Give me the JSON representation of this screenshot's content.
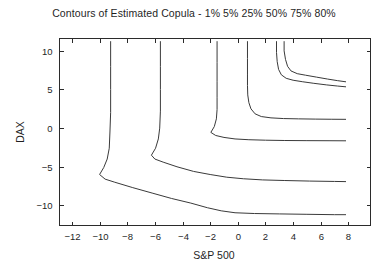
{
  "figure": {
    "width": 388,
    "height": 272,
    "background": "#ffffff",
    "line_color": "#3a3a3a",
    "axis_color": "#2b2b2b",
    "text_color": "#1f1f1f"
  },
  "chart_data": {
    "type": "line",
    "title": "Contours of Estimated Copula - 1% 5% 25% 50% 75% 80%",
    "xlabel": "S&P 500",
    "ylabel": "DAX",
    "xlim": [
      -12.9,
      9.6
    ],
    "ylim": [
      -12.6,
      11.6
    ],
    "xticks": [
      -12,
      -10,
      -8,
      -6,
      -4,
      -2,
      0,
      2,
      4,
      6,
      8
    ],
    "xticklabels": [
      "-12",
      "-10",
      "-8",
      "-6",
      "-4",
      "-2",
      "0",
      "2",
      "4",
      "6",
      "8"
    ],
    "yticks": [
      10,
      5,
      0,
      -5,
      -10
    ],
    "yticklabels": [
      "10",
      "5",
      "0",
      "-5",
      "-10"
    ],
    "grid": false,
    "legend": "none",
    "legend_in_title": true,
    "series": [
      {
        "name": "1%",
        "level": 0.01,
        "points": [
          [
            -9.2,
            11.2
          ],
          [
            -9.2,
            8.0
          ],
          [
            -9.2,
            5.0
          ],
          [
            -9.2,
            2.0
          ],
          [
            -9.25,
            -0.5
          ],
          [
            -9.3,
            -2.6
          ],
          [
            -9.45,
            -4.0
          ],
          [
            -9.7,
            -5.1
          ],
          [
            -10.0,
            -6.0
          ],
          [
            -9.6,
            -6.6
          ],
          [
            -8.9,
            -7.0
          ],
          [
            -7.6,
            -7.7
          ],
          [
            -6.2,
            -8.4
          ],
          [
            -4.8,
            -9.1
          ],
          [
            -3.4,
            -9.7
          ],
          [
            -2.2,
            -10.3
          ],
          [
            -1.2,
            -10.7
          ],
          [
            -0.2,
            -10.95
          ],
          [
            1.2,
            -11.05
          ],
          [
            3.0,
            -11.1
          ],
          [
            5.0,
            -11.15
          ],
          [
            7.0,
            -11.2
          ],
          [
            7.8,
            -11.2
          ]
        ]
      },
      {
        "name": "5%",
        "level": 0.05,
        "points": [
          [
            -5.6,
            11.2
          ],
          [
            -5.6,
            8.0
          ],
          [
            -5.6,
            5.0
          ],
          [
            -5.6,
            2.2
          ],
          [
            -5.65,
            0.0
          ],
          [
            -5.75,
            -1.4
          ],
          [
            -5.95,
            -2.6
          ],
          [
            -6.25,
            -3.5
          ],
          [
            -6.0,
            -4.0
          ],
          [
            -5.4,
            -4.4
          ],
          [
            -4.4,
            -5.0
          ],
          [
            -3.2,
            -5.6
          ],
          [
            -2.0,
            -6.0
          ],
          [
            -0.8,
            -6.35
          ],
          [
            0.4,
            -6.55
          ],
          [
            1.8,
            -6.7
          ],
          [
            3.4,
            -6.78
          ],
          [
            5.2,
            -6.85
          ],
          [
            7.0,
            -6.9
          ],
          [
            7.8,
            -6.92
          ]
        ]
      },
      {
        "name": "25%",
        "level": 0.25,
        "points": [
          [
            -1.5,
            11.2
          ],
          [
            -1.5,
            8.5
          ],
          [
            -1.5,
            6.0
          ],
          [
            -1.5,
            4.0
          ],
          [
            -1.5,
            2.4
          ],
          [
            -1.55,
            1.2
          ],
          [
            -1.7,
            0.2
          ],
          [
            -1.95,
            -0.55
          ],
          [
            -1.6,
            -0.95
          ],
          [
            -1.0,
            -1.2
          ],
          [
            -0.2,
            -1.4
          ],
          [
            0.8,
            -1.5
          ],
          [
            2.0,
            -1.56
          ],
          [
            3.4,
            -1.6
          ],
          [
            5.0,
            -1.62
          ],
          [
            6.6,
            -1.63
          ],
          [
            7.8,
            -1.64
          ]
        ]
      },
      {
        "name": "50%",
        "level": 0.5,
        "points": [
          [
            0.7,
            11.2
          ],
          [
            0.7,
            9.0
          ],
          [
            0.7,
            7.0
          ],
          [
            0.7,
            5.5
          ],
          [
            0.72,
            4.3
          ],
          [
            0.8,
            3.3
          ],
          [
            0.95,
            2.5
          ],
          [
            1.25,
            1.85
          ],
          [
            1.7,
            1.5
          ],
          [
            2.4,
            1.33
          ],
          [
            3.3,
            1.24
          ],
          [
            4.4,
            1.2
          ],
          [
            5.6,
            1.17
          ],
          [
            6.8,
            1.15
          ],
          [
            7.8,
            1.14
          ]
        ]
      },
      {
        "name": "75%",
        "level": 0.75,
        "points": [
          [
            2.8,
            11.2
          ],
          [
            2.8,
            9.8
          ],
          [
            2.85,
            8.6
          ],
          [
            2.95,
            7.6
          ],
          [
            3.15,
            6.9
          ],
          [
            3.5,
            6.45
          ],
          [
            4.0,
            6.2
          ],
          [
            4.7,
            6.0
          ],
          [
            5.5,
            5.8
          ],
          [
            6.4,
            5.6
          ],
          [
            7.2,
            5.45
          ],
          [
            7.8,
            5.35
          ]
        ]
      },
      {
        "name": "80%",
        "level": 0.8,
        "points": [
          [
            3.35,
            11.2
          ],
          [
            3.35,
            10.0
          ],
          [
            3.45,
            8.9
          ],
          [
            3.6,
            8.0
          ],
          [
            3.85,
            7.4
          ],
          [
            4.3,
            7.05
          ],
          [
            4.9,
            6.85
          ],
          [
            5.7,
            6.6
          ],
          [
            6.5,
            6.35
          ],
          [
            7.2,
            6.15
          ],
          [
            7.8,
            6.0
          ]
        ]
      }
    ]
  }
}
